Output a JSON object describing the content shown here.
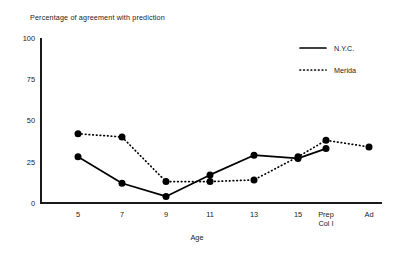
{
  "chart_data": {
    "type": "line",
    "title": "Percentage of agreement with prediction",
    "xlabel": "Age",
    "ylabel": "",
    "categories": [
      "5",
      "7",
      "9",
      "11",
      "13",
      "15",
      "Prep\nCol I",
      "Ad"
    ],
    "category_labels": [
      {
        "line1": "5",
        "line2": ""
      },
      {
        "line1": "7",
        "line2": ""
      },
      {
        "line1": "9",
        "line2": ""
      },
      {
        "line1": "11",
        "line2": ""
      },
      {
        "line1": "13",
        "line2": ""
      },
      {
        "line1": "15",
        "line2": ""
      },
      {
        "line1": "Prep",
        "line2": "Col I"
      },
      {
        "line1": "Ad",
        "line2": ""
      }
    ],
    "yticks": [
      0,
      25,
      50,
      75,
      100
    ],
    "ytick_labels": [
      "0",
      "25",
      "50",
      "75",
      "100"
    ],
    "ylim": [
      0,
      100
    ],
    "grid": false,
    "legend_position": "top-right",
    "series": [
      {
        "name": "N.Y.C.",
        "style": "solid",
        "marker": "filled-circle",
        "color": "#000000",
        "values": [
          28,
          12,
          4,
          17,
          29,
          27,
          33,
          null
        ]
      },
      {
        "name": "Merida",
        "style": "dotted",
        "marker": "filled-circle",
        "color": "#000000",
        "values": [
          42,
          40,
          13,
          13,
          14,
          28,
          38,
          34
        ]
      }
    ]
  },
  "legend": {
    "entries": [
      {
        "label": "N.Y.C.",
        "style": "solid"
      },
      {
        "label": "Merida",
        "style": "dotted"
      }
    ]
  },
  "colors": {
    "ink": "#1a1a1a",
    "series": "#000000",
    "background": "#ffffff"
  }
}
